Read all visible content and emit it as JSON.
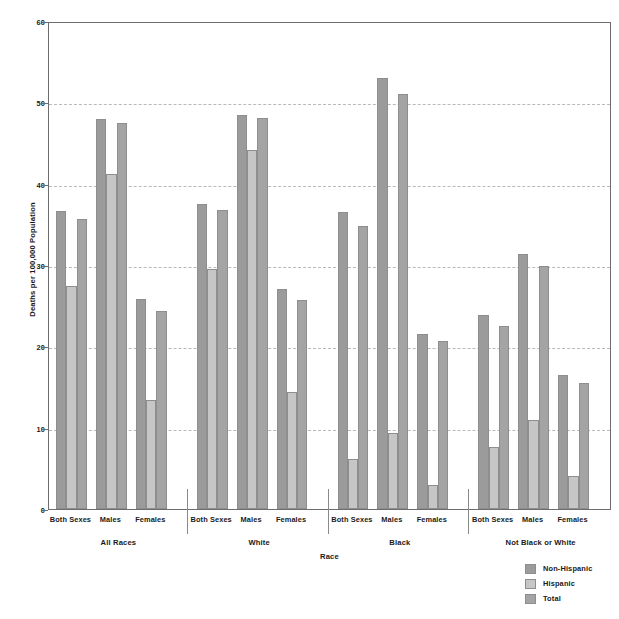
{
  "chart_data": {
    "type": "bar",
    "title": "",
    "xlabel": "Race",
    "ylabel": "Deaths per 100,000 Population",
    "ylim": [
      0,
      60
    ],
    "yticks": [
      0,
      10,
      20,
      30,
      40,
      50,
      60
    ],
    "grid": "horizontal-dashed",
    "legend_position": "bottom-right",
    "groups": [
      "All Races",
      "White",
      "Black",
      "Not Black or White"
    ],
    "subgroups": [
      "Both Sexes",
      "Males",
      "Females"
    ],
    "categories": [
      "All Races - Both Sexes",
      "All Races - Males",
      "All Races - Females",
      "White - Both Sexes",
      "White - Males",
      "White - Females",
      "Black - Both Sexes",
      "Black - Males",
      "Black - Females",
      "Not Black or White - Both Sexes",
      "Not Black or White - Males",
      "Not Black or White - Females"
    ],
    "series": [
      {
        "name": "Non-Hispanic",
        "color": "#9b9b9b",
        "values": [
          36.7,
          48.0,
          25.8,
          37.5,
          48.4,
          27.1,
          36.5,
          53.0,
          21.5,
          23.8,
          31.4,
          16.5
        ]
      },
      {
        "name": "Hispanic",
        "color": "#c6c6c6",
        "values": [
          27.4,
          41.2,
          13.4,
          29.5,
          44.2,
          14.4,
          6.1,
          9.4,
          3.0,
          7.6,
          10.9,
          4.1
        ]
      },
      {
        "name": "Total",
        "color": "#a4a4a4",
        "values": [
          35.7,
          47.4,
          24.3,
          36.8,
          48.1,
          25.7,
          34.8,
          51.0,
          20.6,
          22.5,
          29.9,
          15.5
        ]
      }
    ]
  },
  "legend": {
    "items": [
      {
        "label": "Non-Hispanic",
        "key": "nonhispanic"
      },
      {
        "label": "Hispanic",
        "key": "hispanic"
      },
      {
        "label": "Total",
        "key": "total"
      }
    ]
  }
}
